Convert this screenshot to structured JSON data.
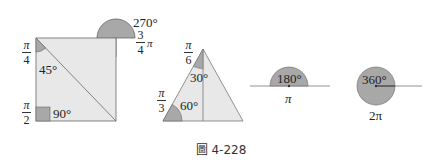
{
  "figures": {
    "square": {
      "angle_45": {
        "degrees": "45°",
        "radian_num": "π",
        "radian_den": "4"
      },
      "angle_90": {
        "degrees": "90°",
        "radian_num": "π",
        "radian_den": "2"
      },
      "angle_270": {
        "degrees": "270°",
        "radian_num": "3",
        "radian_den": "4",
        "radian_suffix": "π"
      }
    },
    "triangle": {
      "angle_30": {
        "degrees": "30°",
        "radian_num": "π",
        "radian_den": "6"
      },
      "angle_60": {
        "degrees": "60°",
        "radian_num": "π",
        "radian_den": "3"
      }
    },
    "straight_angle": {
      "degrees": "180°",
      "radian": "π"
    },
    "full_angle": {
      "degrees": "360°",
      "radian": "2π"
    }
  },
  "caption": "圖 4-228",
  "colors": {
    "fill_light": "#e8e8e8",
    "fill_dark": "#a8a8a8",
    "stroke": "#555555"
  }
}
